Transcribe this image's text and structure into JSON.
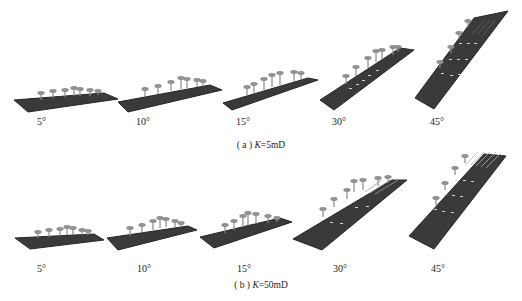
{
  "figure": {
    "panels": [
      {
        "id": "a",
        "caption_prefix": "( a )",
        "caption_var": "K",
        "caption_value": "=5mD",
        "angles": [
          "5°",
          "10°",
          "15°",
          "30°",
          "45°"
        ]
      },
      {
        "id": "b",
        "caption_prefix": "( b )",
        "caption_var": "K",
        "caption_value": "=50mD",
        "angles": [
          "5°",
          "10°",
          "15°",
          "30°",
          "45°"
        ]
      }
    ],
    "colors": {
      "plate": "#3a3a3a",
      "plate_edge": "#262626",
      "well": "#8a8a8a",
      "marker": "#d8d8d8"
    }
  }
}
